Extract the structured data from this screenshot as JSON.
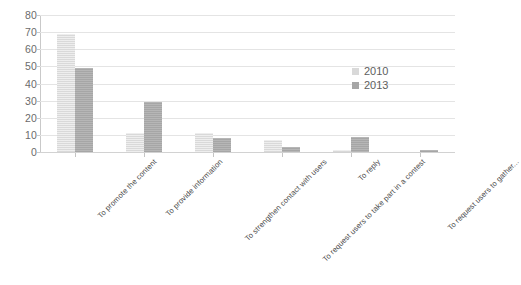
{
  "chart_data": {
    "type": "bar",
    "title": "",
    "subtitle": "",
    "xlabel": "",
    "ylabel": "",
    "ylim": [
      0,
      80
    ],
    "yticks": [
      0,
      10,
      20,
      30,
      40,
      50,
      60,
      70,
      80
    ],
    "ytick_labels": [
      "0",
      "10",
      "20",
      "30",
      "40",
      "50",
      "60",
      "70",
      "80"
    ],
    "grid": true,
    "legend_position": "center-right",
    "categories": [
      "To promote the content",
      "To provide information",
      "To strengthen contact with users",
      "To request users to take part in a contest",
      "To reply",
      "To request users to gather..."
    ],
    "series": [
      {
        "name": "2010",
        "color": "#d9d9d9",
        "values": [
          69,
          11,
          11,
          7,
          1,
          0
        ]
      },
      {
        "name": "2013",
        "color": "#a6a6a6",
        "values": [
          49,
          29,
          8,
          3,
          9,
          1
        ]
      }
    ]
  },
  "legend": {
    "entries": [
      {
        "label": "2010"
      },
      {
        "label": "2013"
      }
    ]
  },
  "colors": {
    "series_2010": "#d9d9d9",
    "series_2013": "#a6a6a6",
    "gridline": "#e4e4e4",
    "axis": "#c9c9c9",
    "text": "#595959",
    "background": "#ffffff"
  }
}
